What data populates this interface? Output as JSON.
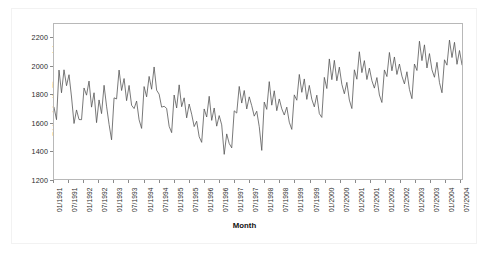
{
  "chart_data": {
    "type": "line",
    "title": "",
    "xlabel": "Month",
    "ylabel": "Ridership (In Thousands)",
    "ylim": [
      1200,
      2300
    ],
    "yticks": [
      1200,
      1400,
      1600,
      1800,
      2000,
      2200
    ],
    "grid": false,
    "legend": null,
    "line_color": "#555555",
    "xtick_labels": [
      "01/1991",
      "07/1991",
      "01/1992",
      "07/1992",
      "01/1993",
      "07/1993",
      "01/1994",
      "07/1994",
      "01/1995",
      "07/1995",
      "01/1996",
      "07/1996",
      "01/1997",
      "07/1997",
      "01/1998",
      "07/1998",
      "01/1999",
      "07/1999",
      "01/2000",
      "07/2000",
      "01/2001",
      "07/2001",
      "01/2002",
      "07/2002",
      "01/2003",
      "07/2003",
      "01/2004",
      "07/2004"
    ],
    "x_start": "01/1991",
    "x_end": "08/2004",
    "x_interval": "monthly",
    "series": [
      {
        "name": "Ridership",
        "values": [
          1709,
          1621,
          1973,
          1812,
          1975,
          1862,
          1940,
          1782,
          1594,
          1690,
          1622,
          1621,
          1846,
          1795,
          1895,
          1710,
          1812,
          1600,
          1761,
          1664,
          1865,
          1717,
          1588,
          1478,
          1776,
          1768,
          1973,
          1828,
          1913,
          1756,
          1864,
          1723,
          1700,
          1753,
          1620,
          1559,
          1856,
          1783,
          1928,
          1837,
          1995,
          1830,
          1802,
          1710,
          1716,
          1701,
          1574,
          1529,
          1796,
          1704,
          1868,
          1713,
          1776,
          1634,
          1732,
          1660,
          1572,
          1610,
          1500,
          1460,
          1697,
          1640,
          1787,
          1616,
          1704,
          1575,
          1650,
          1584,
          1375,
          1520,
          1452,
          1421,
          1684,
          1668,
          1857,
          1739,
          1828,
          1697,
          1783,
          1720,
          1646,
          1681,
          1571,
          1403,
          1746,
          1694,
          1891,
          1724,
          1826,
          1685,
          1768,
          1698,
          1654,
          1710,
          1603,
          1552,
          1797,
          1759,
          1942,
          1815,
          1910,
          1765,
          1864,
          1766,
          1712,
          1795,
          1664,
          1637,
          1921,
          1842,
          2052,
          1905,
          2042,
          1897,
          1994,
          1872,
          1805,
          1886,
          1760,
          1700,
          1975,
          1908,
          2103,
          1955,
          2040,
          1906,
          1987,
          1898,
          1845,
          1920,
          1796,
          1743,
          1974,
          1927,
          2098,
          1968,
          2066,
          1942,
          2016,
          1930,
          1875,
          1961,
          1836,
          1770,
          2016,
          1970,
          2178,
          2040,
          2152,
          1988,
          2090,
          1975,
          1922,
          2028,
          1884,
          1812,
          2046,
          2008,
          2186,
          2062,
          2170,
          2014,
          2112,
          2010
        ]
      }
    ]
  }
}
